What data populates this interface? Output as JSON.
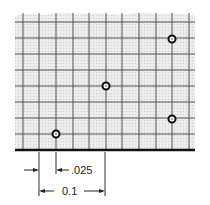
{
  "diagram": {
    "type": "grid-with-points",
    "grid": {
      "vertical_lines_x": [
        23,
        39,
        56,
        73,
        89,
        106,
        122,
        139,
        156,
        172,
        189
      ],
      "horizontal_lines_y": [
        22,
        38,
        54,
        70,
        86,
        102,
        118,
        134
      ],
      "baseline_y": 150,
      "left": 15,
      "right": 195,
      "top": 13,
      "fill_color": "#e4e4e4",
      "line_color": "#555555"
    },
    "points": [
      {
        "id": "point-1",
        "x": 56,
        "y": 134
      },
      {
        "id": "point-2",
        "x": 106,
        "y": 86
      },
      {
        "id": "point-3",
        "x": 172,
        "y": 39
      },
      {
        "id": "point-4",
        "x": 172,
        "y": 119
      }
    ],
    "dimensions": {
      "small": {
        "label": ".025"
      },
      "large": {
        "label": "0.1"
      }
    }
  }
}
